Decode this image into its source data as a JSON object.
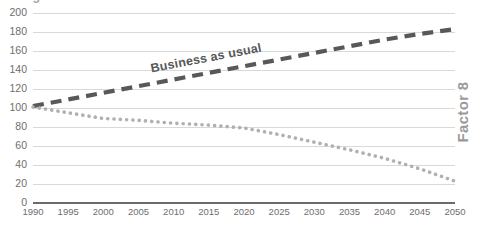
{
  "chart_data": {
    "type": "line",
    "title": "",
    "subtitle": "",
    "xlabel": "",
    "ylabel": "",
    "right_axis_title": "Factor 8",
    "xlim": [
      1990,
      2050
    ],
    "ylim": [
      0,
      200
    ],
    "grid": true,
    "grid_axis": "y",
    "legend_position": "inline-annotation",
    "x_tick_labels": [
      "1990",
      "1995",
      "2000",
      "2005",
      "2010",
      "2015",
      "2020",
      "2025",
      "2030",
      "2035",
      "2040",
      "2045",
      "2050"
    ],
    "y_tick_labels": [
      "0",
      "20",
      "40",
      "60",
      "80",
      "100",
      "120",
      "140",
      "160",
      "180",
      "200"
    ],
    "x": [
      1990,
      1995,
      2000,
      2005,
      2010,
      2015,
      2020,
      2025,
      2030,
      2035,
      2040,
      2045,
      2050
    ],
    "series": [
      {
        "name": "Business as usual",
        "label": "Business as usual",
        "style": "dashed",
        "color": "#585858",
        "values": [
          102,
          109,
          116,
          123,
          130,
          137,
          144,
          151,
          158,
          165,
          172,
          178,
          183
        ]
      },
      {
        "name": "Climate change",
        "label": "Climate change",
        "style": "dotted",
        "color": "#b0b0b0",
        "values": [
          101,
          95,
          89,
          87,
          84,
          82,
          79,
          72,
          64,
          56,
          47,
          36,
          23
        ]
      }
    ],
    "annotations": [
      {
        "text": "Business as usual",
        "series": "Business as usual",
        "color": "#585858"
      },
      {
        "text": "Climate change",
        "series": "Climate change",
        "color": "#a8a8a8"
      }
    ],
    "colors": {
      "business_as_usual": "#585858",
      "climate_change": "#b0b0b0",
      "gridline": "#d9d9d9",
      "axis_line": "#6b6b6b",
      "tick_text": "#6e6e6e",
      "right_title": "#9a9a9a",
      "background": "#ffffff"
    }
  }
}
